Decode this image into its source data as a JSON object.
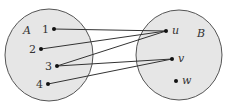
{
  "diagram": {
    "type": "set-mapping",
    "sets": [
      {
        "name": "A",
        "elements": [
          "1",
          "2",
          "3",
          "4"
        ]
      },
      {
        "name": "B",
        "elements": [
          "u",
          "v",
          "w"
        ]
      }
    ],
    "mappings": [
      {
        "from": "1",
        "to": "u"
      },
      {
        "from": "2",
        "to": "u"
      },
      {
        "from": "3",
        "to": "u"
      },
      {
        "from": "3",
        "to": "v"
      },
      {
        "from": "4",
        "to": "v"
      }
    ],
    "labels": {
      "setA": "A",
      "setB": "B",
      "a1": "1",
      "a2": "2",
      "a3": "3",
      "a4": "4",
      "bu": "u",
      "bv": "v",
      "bw": "w"
    },
    "colors": {
      "fill": "#e6e6e6",
      "stroke": "#555555",
      "point": "#111111"
    }
  }
}
